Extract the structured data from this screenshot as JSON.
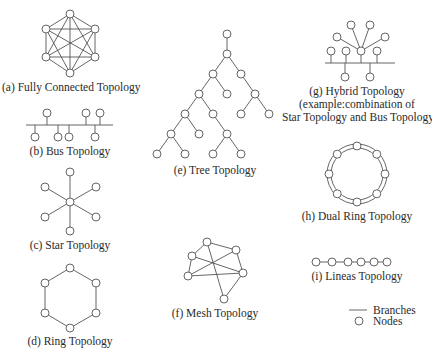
{
  "colors": {
    "line": "#555555",
    "text": "#2a2a2a",
    "background": "#ffffff",
    "node_fill": "#ffffff"
  },
  "panels": [
    {
      "id": "a",
      "label": "(a) Fully Connected Topology"
    },
    {
      "id": "b",
      "label": "(b) Bus Topology"
    },
    {
      "id": "c",
      "label": "(c) Star Topology"
    },
    {
      "id": "d",
      "label": "(d) Ring Topology"
    },
    {
      "id": "e",
      "label": "(e) Tree Topology"
    },
    {
      "id": "f",
      "label": "(f) Mesh Topology"
    },
    {
      "id": "g",
      "label": "(g) Hybrid Topology",
      "label_line2": "(example:combination of",
      "label_line3": "Star Topology and Bus Topology)"
    },
    {
      "id": "h",
      "label": "(h) Dual Ring Topology"
    },
    {
      "id": "i",
      "label": "(i) Lineas Topology"
    }
  ],
  "legend": {
    "branches": "Branches",
    "nodes": "Nodes"
  },
  "graphs": {
    "fully_connected": {
      "nodes": [
        [
          70,
          14
        ],
        [
          46,
          29
        ],
        [
          95,
          29
        ],
        [
          46,
          57
        ],
        [
          95,
          57
        ],
        [
          70,
          73
        ]
      ],
      "edges": "all-pairs"
    },
    "bus": {
      "bus_line": [
        26,
        125,
        113,
        125
      ],
      "upper_nodes_x": [
        47,
        86,
        100
      ],
      "upper_y": 113,
      "lower_nodes_x": [
        35,
        58,
        69,
        95
      ],
      "lower_y": 137
    },
    "star": {
      "center": [
        70,
        202
      ],
      "leaves": [
        [
          70,
          172
        ],
        [
          45,
          187
        ],
        [
          96,
          187
        ],
        [
          45,
          217
        ],
        [
          96,
          217
        ],
        [
          70,
          231
        ]
      ]
    },
    "ring": {
      "nodes": [
        [
          70,
          268
        ],
        [
          96,
          283
        ],
        [
          96,
          313
        ],
        [
          70,
          328
        ],
        [
          45,
          313
        ],
        [
          45,
          283
        ]
      ]
    },
    "tree": {
      "nodes": [
        [
          227,
          34
        ],
        [
          227,
          54
        ],
        [
          213,
          74
        ],
        [
          241,
          74
        ],
        [
          199,
          94
        ],
        [
          227,
          94
        ],
        [
          255,
          94
        ],
        [
          185,
          114
        ],
        [
          213,
          114
        ],
        [
          241,
          114
        ],
        [
          269,
          114
        ],
        [
          171,
          134
        ],
        [
          199,
          134
        ],
        [
          227,
          134
        ],
        [
          157,
          154
        ],
        [
          185,
          154
        ],
        [
          213,
          154
        ],
        [
          241,
          154
        ]
      ],
      "edges": [
        [
          0,
          1
        ],
        [
          1,
          2
        ],
        [
          1,
          3
        ],
        [
          2,
          4
        ],
        [
          2,
          5
        ],
        [
          3,
          6
        ],
        [
          4,
          7
        ],
        [
          4,
          8
        ],
        [
          6,
          9
        ],
        [
          6,
          10
        ],
        [
          7,
          11
        ],
        [
          7,
          12
        ],
        [
          8,
          13
        ],
        [
          11,
          14
        ],
        [
          11,
          15
        ],
        [
          13,
          16
        ],
        [
          13,
          17
        ]
      ]
    },
    "mesh": {
      "nodes": [
        [
          207,
          242
        ],
        [
          192,
          256
        ],
        [
          236,
          250
        ],
        [
          188,
          276
        ],
        [
          243,
          273
        ],
        [
          224,
          299
        ]
      ],
      "edges": [
        [
          0,
          2
        ],
        [
          0,
          1
        ],
        [
          0,
          5
        ],
        [
          1,
          3
        ],
        [
          1,
          4
        ],
        [
          3,
          2
        ],
        [
          3,
          4
        ],
        [
          2,
          4
        ],
        [
          4,
          5
        ]
      ]
    },
    "hybrid": {
      "bus_line": [
        325,
        63,
        395,
        63
      ],
      "hub": [
        361,
        51
      ],
      "star_leaves": [
        [
          337,
          37
        ],
        [
          351,
          25
        ],
        [
          370,
          25
        ],
        [
          385,
          37
        ]
      ],
      "upper_nodes": [
        [
          331,
          51
        ],
        [
          346,
          51
        ],
        [
          377,
          51
        ]
      ],
      "lower_nodes": [
        [
          345,
          77
        ],
        [
          370,
          77
        ]
      ]
    },
    "dual_ring": {
      "center": [
        357,
        174
      ],
      "r_inner": 26,
      "r_outer": 30,
      "r_nodes": 28,
      "node_count": 8
    },
    "linear": {
      "nodes_x": [
        316,
        332,
        348,
        361,
        374,
        387
      ],
      "y": 262
    }
  }
}
